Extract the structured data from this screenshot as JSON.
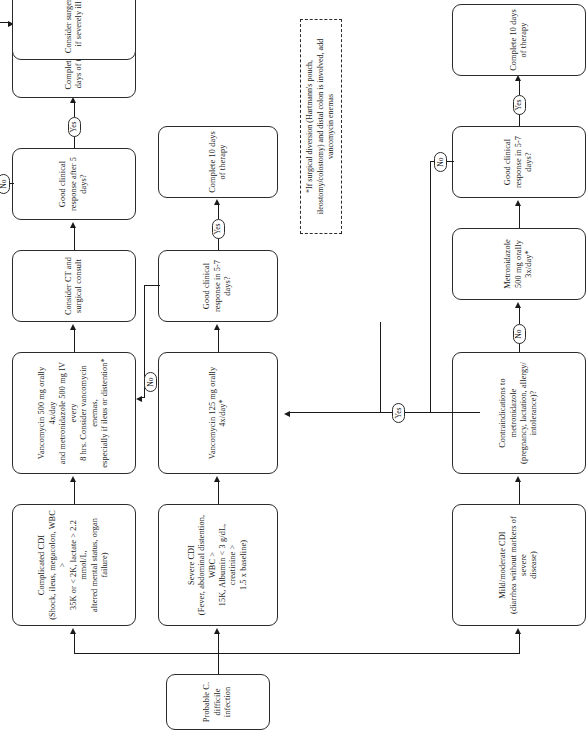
{
  "diagram": {
    "orientation": "left-to-right flowchart rendered rotated 90 degrees",
    "nodes": {
      "start": "Probable C. difficile infection",
      "mild_moderate": "Mild/moderate CDI\n(diarrhea without markers of severe disease)",
      "severe": "Severe CDI\n(Fever, abdominal distention, WBC > 15K, Albumin < 3 g/dL, creatinine > 1.5 x baseline)",
      "complicated": "Complicated CDI\n(Shock, ileus, megacolon, WBC > 35K or < 2K, lactate > 2.2 mmol/L, altered mental status, organ failure)",
      "contraindications": "Contraindications to metronidazole (pregnancy, lactation, allergy/intolerance)?",
      "metronidazole": "Metronidazole 500 mg orally 3x/day*",
      "vanco125": "Vancomycin 125 mg orally 4x/day*",
      "vanco_combo": "Vancomycin 500 mg orally 4x/day and metronidazole 500 mg IV every 8 hrs. Consider vancomycin enemas, especially if ileus or distention*",
      "response_mild": "Good clinical response in 5-7 days?",
      "response_severe": "Good clinical response in 5-7 days?",
      "response_complicated": "Good clinical response after 5 days?",
      "complete10_mild": "Complete 10 days of therapy",
      "complete10_severe": "Complete 10 days of therapy",
      "ct_surgical": "Consider CT and surgical consult",
      "complete1014": "Complete 10-14 days of therapy",
      "surgery": "Consider surgery if severely ill"
    },
    "node_lines": {
      "start": [
        "Probable C. difficile infection"
      ],
      "mild_moderate": [
        "Mild/moderate CDI",
        "(diarrhea without markers of severe",
        "disease)"
      ],
      "severe": [
        "Severe CDI",
        "(Fever, abdominal distention, WBC >",
        "15K, Albumin < 3 g/dL, creatinine >",
        "1.5 x baseline)"
      ],
      "complicated": [
        "Complicated CDI",
        "(Shock, ileus, megacolon, WBC >",
        "35K or < 2K, lactate > 2.2 mmol/L,",
        "altered mental status, organ failure)"
      ],
      "contraindications": [
        "Contraindications to metronidazole",
        "(pregnancy, lactation, allergy/",
        "intolerance)?"
      ],
      "metronidazole": [
        "Metronidazole 500 mg orally 3x/day*"
      ],
      "vanco125": [
        "Vancomycin 125 mg orally 4x/day*"
      ],
      "vanco_combo": [
        "Vancomycin 500 mg orally 4x/day",
        "and metronidazole 500 mg IV every",
        "8 hrs. Consider vancomycin enemas,",
        "especially if ileus or distention*"
      ],
      "response_mild": [
        "Good clinical response in 5-7 days?"
      ],
      "response_severe": [
        "Good clinical response in 5-7 days?"
      ],
      "response_complicated": [
        "Good clinical response after 5 days?"
      ],
      "complete10_mild": [
        "Complete 10 days of therapy"
      ],
      "complete10_severe": [
        "Complete 10 days of therapy"
      ],
      "ct_surgical": [
        "Consider CT and surgical consult"
      ],
      "complete1014": [
        "Complete 10-14 days of therapy"
      ],
      "surgery": [
        "Consider surgery if severely ill"
      ]
    },
    "edge_labels": {
      "contraindications_no": "No",
      "contraindications_yes": "Yes",
      "response_mild_yes": "Yes",
      "response_mild_no": "No",
      "response_severe_yes": "Yes",
      "response_severe_no": "No",
      "response_complicated_yes": "Yes",
      "response_complicated_no": "No"
    },
    "footnote_lines": [
      "*If surgical diversion (Hartmann's pouch, ileostomy/colostomy)",
      "and distal colon is involved, add vancomycin enemas"
    ],
    "colors": {
      "stroke": "#2b2b2b",
      "background": "#ffffff",
      "text": "#1a1a1a"
    }
  }
}
